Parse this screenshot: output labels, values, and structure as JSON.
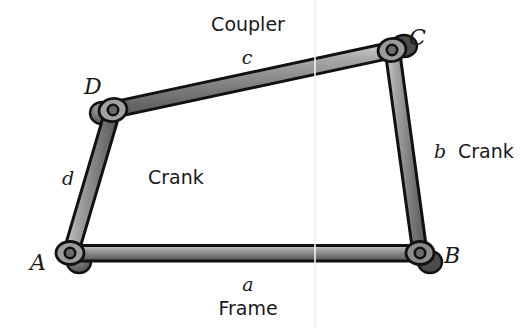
{
  "figure": {
    "background_color": "#ffffff",
    "outline_color": "#111111",
    "bar_light_color": "#b9b9b9",
    "bar_mid_color": "#8f8f8f",
    "bar_dark_color": "#5e5e5e",
    "pivot_fill_color": "#6f6f6f",
    "text_color": "#1a1a1a"
  },
  "joints": [
    {
      "id": "A",
      "label": "A",
      "x": 70,
      "y": 253,
      "label_x": 30,
      "label_y": 252
    },
    {
      "id": "B",
      "label": "B",
      "x": 420,
      "y": 253,
      "label_x": 444,
      "label_y": 245
    },
    {
      "id": "C",
      "label": "C",
      "x": 392,
      "y": 50,
      "label_x": 409,
      "label_y": 27
    },
    {
      "id": "D",
      "label": "D",
      "x": 113,
      "y": 110,
      "label_x": 84,
      "label_y": 76
    }
  ],
  "links": [
    {
      "id": "a",
      "name": "frame-link",
      "from": "A",
      "to": "B",
      "length_label": "a",
      "role_label": "Frame",
      "length_label_x": 248,
      "length_label_y": 275,
      "role_label_x": 248,
      "role_label_y": 299
    },
    {
      "id": "b",
      "name": "crank-link-right",
      "from": "B",
      "to": "C",
      "length_label": "b",
      "role_label": "Crank",
      "length_label_x": 434,
      "length_label_y": 142,
      "role_label_x": 458,
      "role_label_y": 142
    },
    {
      "id": "c",
      "name": "coupler-link",
      "from": "D",
      "to": "C",
      "length_label": "c",
      "role_label": "Coupler",
      "length_label_x": 247,
      "length_label_y": 48,
      "role_label_x": 248,
      "role_label_y": 15
    },
    {
      "id": "d",
      "name": "crank-link-left",
      "from": "A",
      "to": "D",
      "length_label": "d",
      "role_label": "Crank",
      "length_label_x": 62,
      "length_label_y": 169,
      "role_label_x": 148,
      "role_label_y": 168
    }
  ]
}
